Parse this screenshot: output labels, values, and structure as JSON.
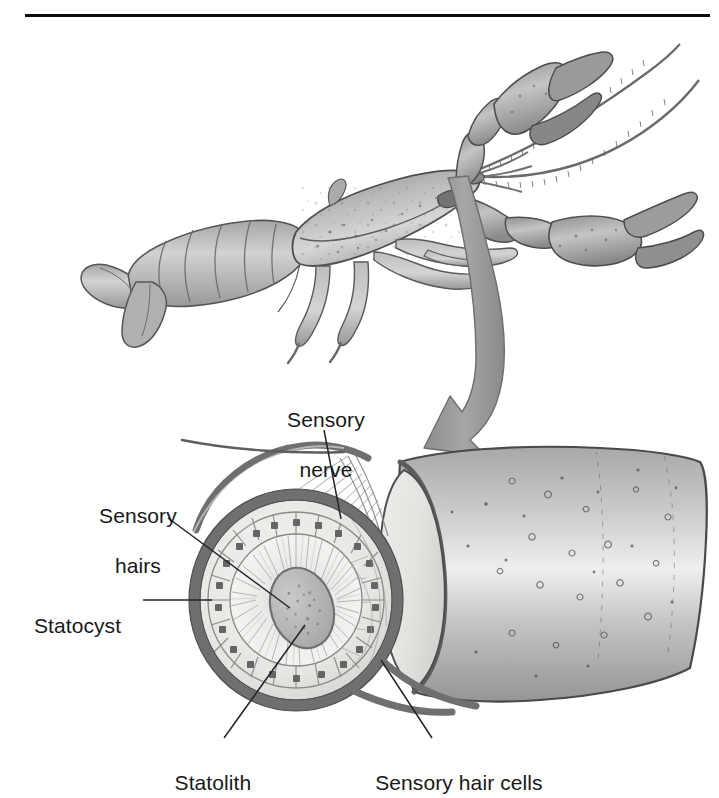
{
  "figure": {
    "top_rule": true
  },
  "labels": [
    {
      "id": "sensory-nerve",
      "text_line1": "Sensory",
      "text_line2": "nerve",
      "x": 320,
      "y": 382,
      "align": "center",
      "leader": {
        "x1": 324,
        "y1": 430,
        "x2": 341,
        "y2": 519
      }
    },
    {
      "id": "sensory-hairs",
      "text_line1": "Sensory",
      "text_line2": "hairs",
      "x": 132,
      "y": 480,
      "align": "center",
      "leader": {
        "x1": 168,
        "y1": 518,
        "x2": 290,
        "y2": 608
      }
    },
    {
      "id": "statocyst",
      "text_line1": "Statocyst",
      "text_line2": "",
      "x": 78,
      "y": 592,
      "align": "center",
      "leader": {
        "x1": 143,
        "y1": 600,
        "x2": 212,
        "y2": 600
      }
    },
    {
      "id": "statolith",
      "text_line1": "Statolith",
      "text_line2": "",
      "x": 207,
      "y": 757,
      "align": "center",
      "leader": {
        "x1": 224,
        "y1": 738,
        "x2": 305,
        "y2": 625
      }
    },
    {
      "id": "sensory-hair-cells",
      "text_line1": "Sensory hair cells",
      "text_line2": "",
      "x": 452,
      "y": 757,
      "align": "center",
      "leader": {
        "x1": 432,
        "y1": 738,
        "x2": 381,
        "y2": 660
      }
    }
  ],
  "colors": {
    "ink": "#18181a",
    "rule": "#0d0d0d",
    "leader": "#23232a",
    "arrow_fill": "#9a9a9a",
    "arrow_stroke": "#6d6d6d",
    "body_light": "#d8d8d8",
    "body_mid": "#b2b2b2",
    "body_dark": "#8a8a8a",
    "outline": "#4a4a4a",
    "capsule_wall": "#6f6f6f",
    "cell_fill": "#eeeeec",
    "hair_fill": "#f4f4f2",
    "statolith_fill": "#b9b9b9",
    "background": "#ffffff"
  },
  "parts": {
    "animal": "crayfish",
    "cutaway_structure": "statocyst capsule in antennule base",
    "arrow": "magnification pointer"
  }
}
